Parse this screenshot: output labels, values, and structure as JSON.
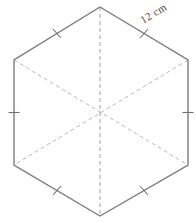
{
  "figure": {
    "name": "regular-hexagon-with-diagonals",
    "shape_type": "hexagon",
    "sides": 6,
    "orientation": "point-up",
    "background_color": "#ffffff",
    "edge_color": "#7d7d7d",
    "diagonal_color": "#b9b9b9",
    "vertical_diagonal_color": "#a2a2a2",
    "tick_color": "#6f6f6f",
    "label_color": "#4a4a4a",
    "side_label": "12 cm",
    "side_length_value": "12",
    "side_length_unit": "cm",
    "label_rotation_degrees": "-31",
    "congruence_tick_count_per_side": "1",
    "vertices": [
      {
        "id": "top",
        "x": "100",
        "y": "7"
      },
      {
        "id": "upper-right",
        "x": "188",
        "y": "60"
      },
      {
        "id": "lower-right",
        "x": "188",
        "y": "165"
      },
      {
        "id": "bottom",
        "x": "100",
        "y": "216"
      },
      {
        "id": "lower-left",
        "x": "14",
        "y": "165"
      },
      {
        "id": "upper-left",
        "x": "14",
        "y": "60"
      }
    ],
    "center": {
      "x": "101",
      "y": "112"
    },
    "edges": [
      {
        "id": "edge-top-left",
        "from": "upper-left",
        "to": "top",
        "has_tick": "true"
      },
      {
        "id": "edge-top-right",
        "from": "top",
        "to": "upper-right",
        "has_tick": "true",
        "label": "12 cm"
      },
      {
        "id": "edge-right",
        "from": "upper-right",
        "to": "lower-right",
        "has_tick": "true"
      },
      {
        "id": "edge-bottom-right",
        "from": "lower-right",
        "to": "bottom",
        "has_tick": "true"
      },
      {
        "id": "edge-bottom-left",
        "from": "bottom",
        "to": "lower-left",
        "has_tick": "true"
      },
      {
        "id": "edge-left",
        "from": "lower-left",
        "to": "upper-left",
        "has_tick": "true"
      }
    ],
    "diagonals": [
      {
        "id": "diagonal-vertical",
        "from": "top",
        "to": "bottom",
        "style": "dashed"
      },
      {
        "id": "diagonal-upper-left-lower-right",
        "from": "upper-left",
        "to": "lower-right",
        "style": "dashed"
      },
      {
        "id": "diagonal-upper-right-lower-left",
        "from": "upper-right",
        "to": "lower-left",
        "style": "dashed"
      }
    ]
  }
}
